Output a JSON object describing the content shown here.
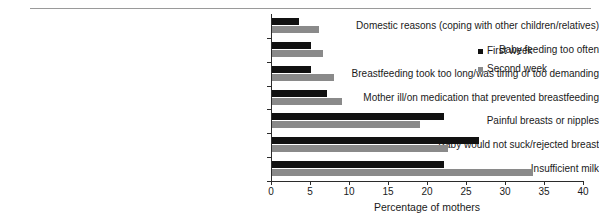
{
  "chart_data": {
    "type": "bar",
    "orientation": "horizontal",
    "title": "",
    "xlabel": "Percentage of mothers",
    "ylabel": "",
    "xlim": [
      0,
      40
    ],
    "xticks": [
      0,
      5,
      10,
      15,
      20,
      25,
      30,
      35,
      40
    ],
    "grid": false,
    "legend_position": "top-right",
    "categories": [
      "Domestic reasons (coping with other children/relatives)",
      "Baby feeding too often",
      "Breastfeeding took too long/was tiring or too demanding",
      "Mother ill/on medication that prevented breastfeeding",
      "Painful breasts or nipples",
      "Baby would not suck/rejected breast",
      "Insufficient milk"
    ],
    "series": [
      {
        "name": "First week",
        "color": "#111111",
        "values": [
          3.5,
          5,
          5,
          7,
          22,
          26.5,
          22
        ]
      },
      {
        "name": "Second week",
        "color": "#8a8a8a",
        "values": [
          6,
          6.5,
          8,
          9,
          19,
          22.5,
          33.5
        ]
      }
    ]
  },
  "legend": {
    "items": [
      {
        "label": "First week",
        "color": "#111111"
      },
      {
        "label": "Second week",
        "color": "#8a8a8a"
      }
    ]
  },
  "axis": {
    "x_title": "Percentage of mothers",
    "x_tick_labels": [
      "0",
      "5",
      "10",
      "15",
      "20",
      "25",
      "30",
      "35",
      "40"
    ]
  }
}
